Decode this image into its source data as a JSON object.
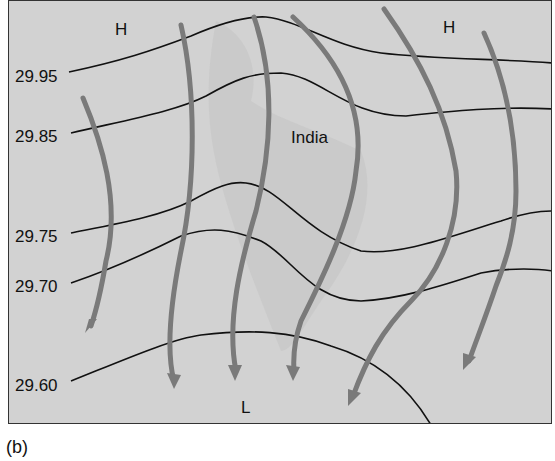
{
  "figure": {
    "caption": "(b)",
    "region_label": "India",
    "pressure_centers": [
      {
        "label": "H",
        "x": 118,
        "y": 28
      },
      {
        "label": "H",
        "x": 447,
        "y": 26
      },
      {
        "label": "L",
        "x": 243,
        "y": 406
      }
    ],
    "isobars": [
      {
        "label": "29.95",
        "label_x": 14,
        "label_y": 75
      },
      {
        "label": "29.85",
        "label_x": 14,
        "label_y": 135
      },
      {
        "label": "29.75",
        "label_x": 14,
        "label_y": 236
      },
      {
        "label": "29.70",
        "label_x": 14,
        "label_y": 286
      },
      {
        "label": "29.60",
        "label_x": 14,
        "label_y": 384
      }
    ],
    "colors": {
      "background": "#d2d2d2",
      "landmass": "#c6c6c6",
      "isobar": "#111111",
      "wind_arrow": "#7a7a7a",
      "border": "#333333"
    }
  }
}
